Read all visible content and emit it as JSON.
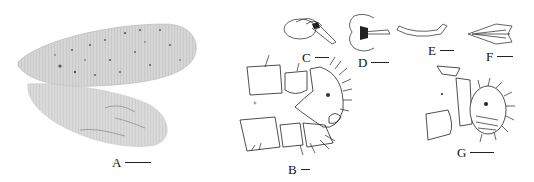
{
  "figure": {
    "panels": [
      {
        "id": "A",
        "label": "A",
        "subject": "forewing and hindwing"
      },
      {
        "id": "B",
        "label": "B",
        "subject": "male terminalia, lateral view"
      },
      {
        "id": "C",
        "label": "C",
        "subject": "genital structure, lateral"
      },
      {
        "id": "D",
        "label": "D",
        "subject": "genital structure, dorsal"
      },
      {
        "id": "E",
        "label": "E",
        "subject": "genital sclerite"
      },
      {
        "id": "F",
        "label": "F",
        "subject": "genital plate"
      },
      {
        "id": "G",
        "label": "G",
        "subject": "female terminalia, lateral view"
      }
    ],
    "scale_bar_icon": "scale-bar",
    "colors": {
      "ink": "#222222",
      "wing_fill": "#d8d8d8",
      "background": "#ffffff"
    }
  }
}
